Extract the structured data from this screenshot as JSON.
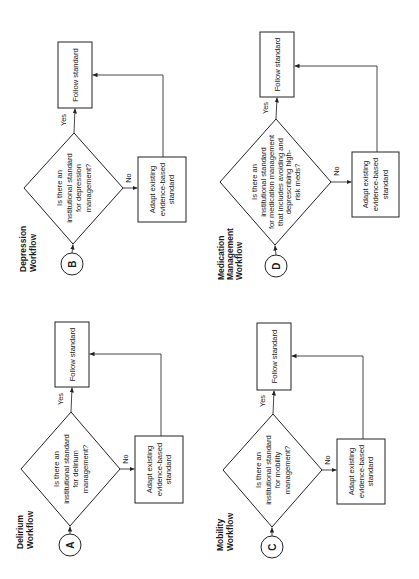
{
  "diagram": {
    "type": "flowchart-set",
    "orientation": "rotated-90-ccw",
    "colors": {
      "stroke": "#222222",
      "text": "#1a1a1a",
      "background": "#ffffff"
    },
    "workflows": [
      {
        "id": "B",
        "connector": "B",
        "title": [
          "Depression",
          "Workflow"
        ],
        "decision": [
          "Is there an",
          "institutional standard",
          "for depression",
          "management?"
        ],
        "yes_label": "Yes",
        "no_label": "No",
        "yes_action": "Follow standard",
        "no_action": [
          "Adapt existing",
          "evidence-based",
          "standard"
        ]
      },
      {
        "id": "D",
        "connector": "D",
        "title": [
          "Medication",
          "Management",
          "Workflow"
        ],
        "decision": [
          "Is there an",
          "institutional standard",
          "for medication management",
          "that includes avoiding and",
          "deprescribing high-",
          "risk meds?"
        ],
        "yes_label": "Yes",
        "no_label": "No",
        "yes_action": "Follow standard",
        "no_action": [
          "Adapt existing",
          "evidence-based",
          "standard"
        ]
      },
      {
        "id": "A",
        "connector": "A",
        "title": [
          "Delirium",
          "Workflow"
        ],
        "decision": [
          "Is there an",
          "institutional standard",
          "for delirium",
          "management?"
        ],
        "yes_label": "Yes",
        "no_label": "No",
        "yes_action": "Follow standard",
        "no_action": [
          "Adapt existing",
          "evidence-based",
          "standard"
        ]
      },
      {
        "id": "C",
        "connector": "C",
        "title": [
          "Mobility",
          "Workflow"
        ],
        "decision": [
          "Is there an",
          "institutional standard",
          "for mobility",
          "management?"
        ],
        "yes_label": "Yes",
        "no_label": "No",
        "yes_action": "Follow standard",
        "no_action": [
          "Adapt existing",
          "evidence-based",
          "standard"
        ]
      }
    ]
  }
}
